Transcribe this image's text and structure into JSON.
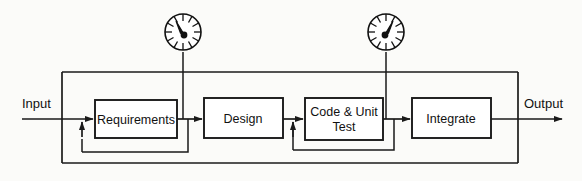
{
  "diagram": {
    "type": "block-flow-diagram",
    "background_color": "#fbfbf9",
    "line_color": "#1a1a1a",
    "io": {
      "input_label": "Input",
      "output_label": "Output"
    },
    "stages": [
      {
        "id": "requirements",
        "label": "Requirements",
        "lines": [
          "Requirements"
        ]
      },
      {
        "id": "design",
        "label": "Design",
        "lines": [
          "Design"
        ]
      },
      {
        "id": "code-unit-test",
        "label": "Code & Unit Test",
        "lines": [
          "Code & Unit",
          "Test"
        ]
      },
      {
        "id": "integrate",
        "label": "Integrate",
        "lines": [
          "Integrate"
        ]
      }
    ],
    "gauges": [
      {
        "id": "gauge-requirements",
        "name": "gauge-meter",
        "needle_direction": "upper-left",
        "attached_to": "requirements-output"
      },
      {
        "id": "gauge-code-unit-test",
        "name": "gauge-meter",
        "needle_direction": "upper-right",
        "attached_to": "code-unit-test-output"
      }
    ],
    "feedback_loops": [
      {
        "id": "loop-requirements",
        "from": "requirements-output",
        "to": "requirements-input"
      },
      {
        "id": "loop-code-unit-test",
        "from": "code-unit-test-output",
        "to": "code-unit-test-input"
      },
      {
        "id": "loop-outer",
        "from": "integrate-output",
        "to": "requirements-input"
      }
    ]
  }
}
